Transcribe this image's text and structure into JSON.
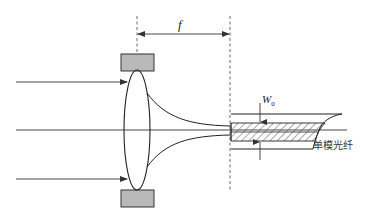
{
  "diagram": {
    "labels": {
      "focal_length": "f",
      "waist_symbol": "W",
      "waist_subscript": "0",
      "fiber": "单模光纤"
    },
    "colors": {
      "line": "#333333",
      "mount_fill": "#b9b9b9",
      "mount_stroke": "#333333",
      "background": "#ffffff"
    },
    "elements": [
      {
        "id": "lens",
        "type": "biconvex-lens"
      },
      {
        "id": "lens-mount-top",
        "type": "block"
      },
      {
        "id": "lens-mount-bottom",
        "type": "block"
      },
      {
        "id": "input-ray-top",
        "type": "arrow"
      },
      {
        "id": "input-ray-bottom",
        "type": "arrow"
      },
      {
        "id": "optical-axis",
        "type": "line"
      },
      {
        "id": "focused-beam",
        "type": "curve"
      },
      {
        "id": "focal-length-dimension",
        "type": "dimension",
        "label": "f"
      },
      {
        "id": "single-mode-fiber",
        "type": "fiber",
        "label": "单模光纤"
      },
      {
        "id": "waist-dimension",
        "type": "dimension",
        "label": "W0"
      }
    ]
  }
}
